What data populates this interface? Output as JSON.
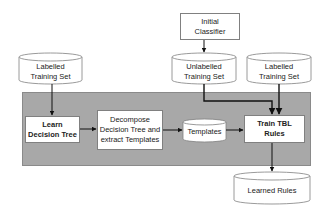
{
  "diagram": {
    "nodes": {
      "initial_classifier": {
        "label": "Initial\nClassifier",
        "shape": "rectangle"
      },
      "labelled_training_set_left": {
        "label": "Labelled\nTraining Set",
        "shape": "cylinder"
      },
      "unlabelled_training_set": {
        "label": "Unlabelled\nTraining Set",
        "shape": "cylinder"
      },
      "labelled_training_set_right": {
        "label": "Labelled\nTraining Set",
        "shape": "cylinder"
      },
      "learn_decision_tree": {
        "label": "Learn\nDecision Tree",
        "shape": "rectangle",
        "bold": true
      },
      "decompose": {
        "label": "Decompose\nDecision Tree and\nextract Templates",
        "shape": "rectangle"
      },
      "templates": {
        "label": "Templates",
        "shape": "cylinder"
      },
      "train_tbl_rules": {
        "label": "Train TBL\nRules",
        "shape": "rectangle",
        "bold": true
      },
      "learned_rules": {
        "label": "Learned Rules",
        "shape": "cylinder"
      }
    },
    "edges": [
      {
        "from": "initial_classifier",
        "to": "unlabelled_training_set"
      },
      {
        "from": "labelled_training_set_left",
        "to": "learn_decision_tree"
      },
      {
        "from": "learn_decision_tree",
        "to": "decompose"
      },
      {
        "from": "decompose",
        "to": "templates"
      },
      {
        "from": "templates",
        "to": "train_tbl_rules"
      },
      {
        "from": "unlabelled_training_set",
        "to": "train_tbl_rules"
      },
      {
        "from": "labelled_training_set_right",
        "to": "train_tbl_rules"
      },
      {
        "from": "train_tbl_rules",
        "to": "learned_rules"
      }
    ],
    "colors": {
      "panel": "#a8a8a8",
      "node_fill": "#ffffff",
      "node_border": "#808080",
      "edge": "#111111"
    }
  }
}
